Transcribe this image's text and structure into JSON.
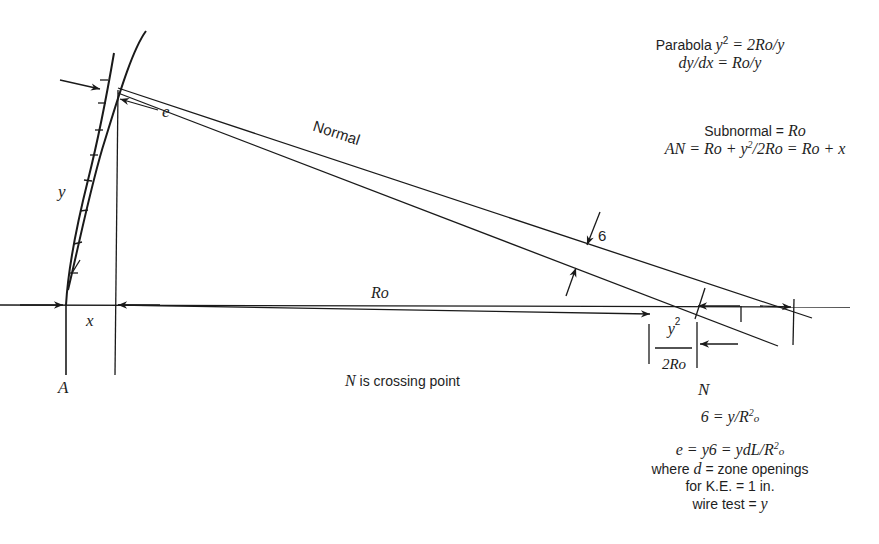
{
  "diagram": {
    "type": "parabola normal geometry (mirror testing)",
    "labels": {
      "A": "A",
      "x": "x",
      "y": "y",
      "e": "e",
      "normal": "Normal",
      "Ro": "Ro",
      "six": "6",
      "N": "N",
      "crossing": "N is crossing point",
      "frac_num": "y",
      "frac_num_exp": "2",
      "frac_den": "2Ro"
    },
    "equations_top": {
      "line1_text": "Parabola ",
      "line1_math": "y",
      "line1_exp": "2",
      "line1_rest": " = 2Ro/y",
      "line2": "dy/dx = Ro/y"
    },
    "equations_mid": {
      "line1_text": "Subnormal = ",
      "line1_math": "Ro",
      "line2_a": "AN = Ro + y",
      "line2_exp": "2",
      "line2_b": "/2Ro = Ro + x"
    },
    "equations_bottom": {
      "line1_a": "6 = y/R",
      "line1_sup": "2",
      "line1_sub": "o",
      "line2_a": "e = y6 = ydL/R",
      "line2_sup": "2",
      "line2_sub": "o",
      "line3_a": "where ",
      "line3_math": "d",
      "line3_b": " = zone openings",
      "line4": "for K.E. = 1 in.",
      "line5_a": "wire test = ",
      "line5_math": "y"
    }
  }
}
